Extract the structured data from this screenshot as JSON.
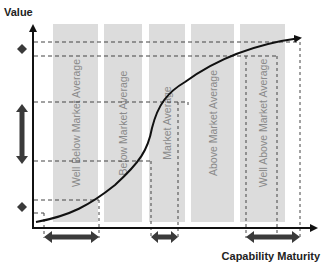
{
  "diagram": {
    "y_axis_label": "Value",
    "x_axis_label": "Capability Maturity",
    "bands": [
      {
        "label": "Well Below Market Average",
        "x": 53,
        "w": 45
      },
      {
        "label": "Below Market Average",
        "x": 104,
        "w": 38
      },
      {
        "label": "Market Average",
        "x": 149,
        "w": 36
      },
      {
        "label": "Above Market Average",
        "x": 191,
        "w": 43
      },
      {
        "label": "Well Above Market Average",
        "x": 240,
        "w": 45
      }
    ],
    "band_top": 24,
    "band_bottom": 222,
    "colors": {
      "band": "#dcdcdc",
      "axis": "#111111",
      "curve": "#111111",
      "dashed": "#444444",
      "marker": "#3a3a3a",
      "band_text": "#8a8a8a"
    },
    "curve_description": "S-shaped maturity curve rising from bottom-left to top-right with arrowhead",
    "horizontal_guides_y": [
      42,
      56,
      102,
      161,
      200,
      213
    ],
    "vertical_guides_x": [
      44,
      99,
      151,
      178,
      246,
      300
    ],
    "x_range_markers": [
      {
        "from": 44,
        "to": 99
      },
      {
        "from": 151,
        "to": 178
      },
      {
        "from": 246,
        "to": 300
      }
    ],
    "y_markers": [
      {
        "type": "diamond",
        "y": 49
      },
      {
        "type": "double-arrow",
        "from": 105,
        "to": 163
      },
      {
        "type": "diamond",
        "y": 207
      }
    ]
  }
}
